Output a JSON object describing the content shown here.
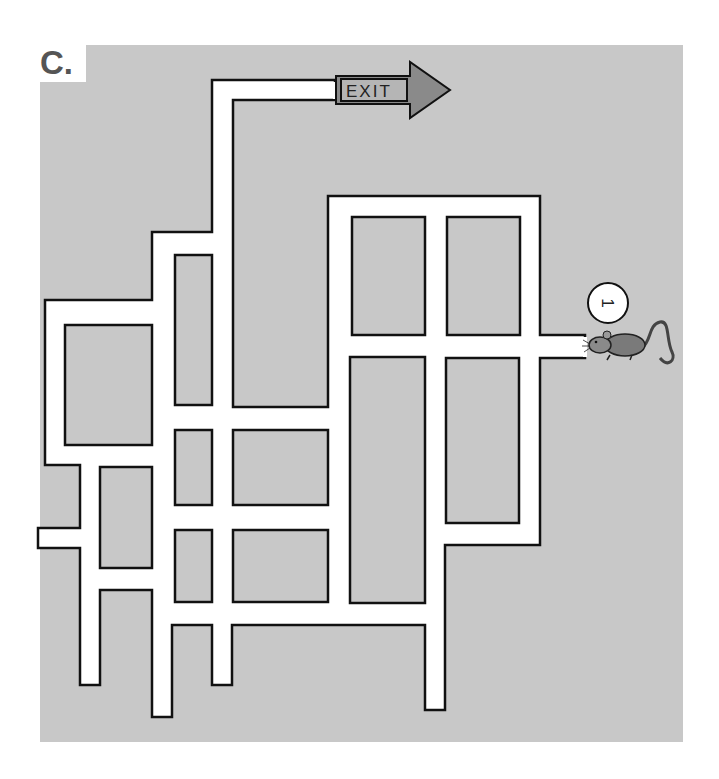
{
  "puzzle": {
    "label": "C.",
    "type": "maze"
  },
  "exit_sign": {
    "text": "EXIT",
    "arrow_color": "#8a8a8a"
  },
  "start_marker": {
    "number": "1",
    "character": "mouse"
  },
  "colors": {
    "background": "#c8c8c8",
    "corridor": "#ffffff",
    "wall": "#111111",
    "label": "#555555"
  }
}
